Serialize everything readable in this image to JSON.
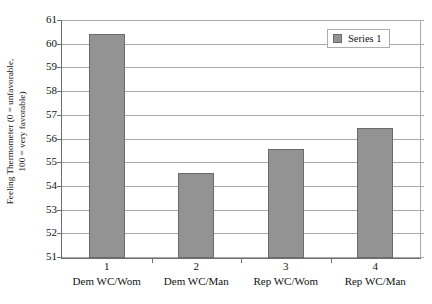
{
  "chart_data": {
    "type": "bar",
    "title": "",
    "xlabel": "",
    "ylabel": "Feeling Thermometer (0 = unfavorable, 100 = very favorable)",
    "ylabel_line1": "Feeling Thermometer (0 = unfavorable,",
    "ylabel_line2": "100 = very favorable)",
    "categories": [
      "Dem WC/Wom",
      "Dem WC/Man",
      "Rep WC/Wom",
      "Rep WC/Man"
    ],
    "category_numbers": [
      "1",
      "2",
      "3",
      "4"
    ],
    "values": [
      60.45,
      54.6,
      55.6,
      56.5
    ],
    "ylim": [
      51,
      61
    ],
    "ytick_step": 1,
    "ytick_labels": [
      "61",
      "60",
      "59",
      "58",
      "57",
      "56",
      "55",
      "54",
      "53",
      "52",
      "51"
    ],
    "grid": true,
    "legend_position": "top-right",
    "series": [
      {
        "name": "Series 1",
        "values": [
          60.45,
          54.6,
          55.6,
          56.5
        ],
        "color": "#939393"
      }
    ]
  },
  "legend": {
    "entries": [
      {
        "label": "Series 1",
        "swatch_name": "legend-swatch-series-1"
      }
    ]
  },
  "colors": {
    "bar_fill": "#939393",
    "bar_border": "#6b6b6b",
    "gridline": "#a8a8a8",
    "axis_line": "#6e6e6e",
    "legend_border": "#adadad",
    "text": "#111111",
    "background": "#ffffff"
  }
}
